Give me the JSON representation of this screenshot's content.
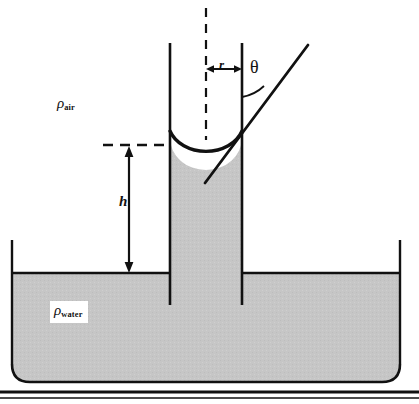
{
  "figure": {
    "colors": {
      "fluid_fill": "#c6c6c6",
      "line": "#111111",
      "background": "#ffffff"
    },
    "labels": {
      "rho_symbol": "ρ",
      "air_subscript": "air",
      "water_subscript": "water",
      "height": "h",
      "radius": "r",
      "contact_angle": "θ"
    },
    "annotations": {
      "rho_air": "ρair",
      "rho_water": "ρwater",
      "capillary_rise_height": "h",
      "tube_radius": "r",
      "contact_angle": "θ"
    },
    "geometry": {
      "tube_left_wall_x": 170,
      "tube_right_wall_x": 242,
      "tube_centerline_x": 206,
      "tube_top_y": 43,
      "meniscus_bottom_y": 155,
      "water_surface_y": 273,
      "tube_bottom_y": 305,
      "reservoir_left_x": 12,
      "reservoir_right_x": 400,
      "reservoir_bottom_y": 382,
      "baseline_thick_y": 392,
      "baseline_thin_y": 398,
      "radius_arrow_y": 69,
      "height_dashed_y": 145,
      "height_arrow_x": 129
    }
  }
}
